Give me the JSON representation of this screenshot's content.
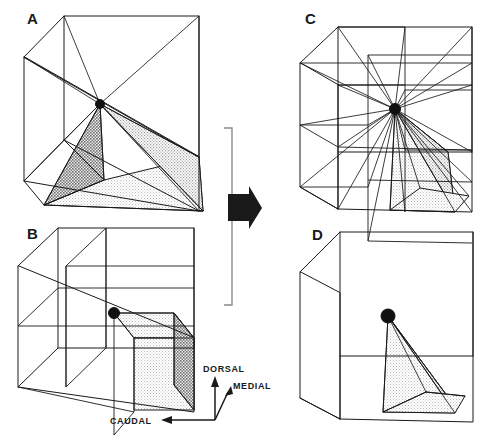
{
  "figure": {
    "background_color": "#ffffff",
    "ink_color": "#1a1a1a",
    "stipple_color": "#d8d8d8"
  },
  "panels": [
    {
      "id": "A",
      "label": "A",
      "description": "Outline cube with rays from all eight corners converging on a central node; bottom pyramid shaded",
      "subdivision": "none",
      "center_node": true,
      "ray_count": 8,
      "shaded_region": "bottom-pyramid"
    },
    {
      "id": "B",
      "label": "B",
      "description": "Cube subdivided into 2x2x2 octants with a central node; front-right-bottom octant shaded",
      "subdivision": "2x2x2",
      "center_node": true,
      "ray_count": 0,
      "shaded_region": "front-right-bottom-octant"
    },
    {
      "id": "C",
      "label": "C",
      "description": "Cube subdivided into 2x2x2 with many rays from every grid vertex converging on the center node; lower-right floor quadrant shaded",
      "subdivision": "2x2x2",
      "center_node": true,
      "ray_count": 26,
      "shaded_region": "lower-right-pyramid"
    },
    {
      "id": "D",
      "label": "D",
      "description": "Plain outline cube with a small shaded pyramid from the central node down to the front-right floor quadrant",
      "subdivision": "none",
      "center_node": true,
      "ray_count": 3,
      "shaded_region": "small-corner-pyramid"
    }
  ],
  "transform_arrow": {
    "name": "transform-arrow",
    "direction": "right",
    "has_bracket": true,
    "bracket_orientation": "vertical"
  },
  "axes_legend": {
    "name": "orientation-axes",
    "labels": {
      "dorsal": "DORSAL",
      "medial": "MEDIAL",
      "caudal": "CAUDAL"
    },
    "directions": {
      "dorsal": "up",
      "medial": "up-right",
      "caudal": "left"
    }
  }
}
